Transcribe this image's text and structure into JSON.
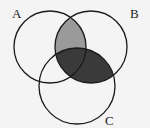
{
  "diagram": {
    "type": "venn",
    "sets": [
      {
        "id": "A",
        "label": "A",
        "cx": 50,
        "cy": 47,
        "r": 36,
        "label_x": 12,
        "label_y": 18
      },
      {
        "id": "B",
        "label": "B",
        "cx": 91,
        "cy": 47,
        "r": 36,
        "label_x": 130,
        "label_y": 18
      },
      {
        "id": "C",
        "label": "C",
        "cx": 77,
        "cy": 86,
        "r": 38,
        "label_x": 105,
        "label_y": 125
      }
    ],
    "shaded_regions": [
      {
        "region": "A∩B∩C'",
        "color": "#9a9a9a"
      },
      {
        "region": "B∩C",
        "color": "#3a3a3a"
      }
    ],
    "colors": {
      "background": "#f4f4f4",
      "stroke": "#1a1a1a",
      "light_shade": "#9a9a9a",
      "dark_shade": "#3a3a3a"
    }
  }
}
